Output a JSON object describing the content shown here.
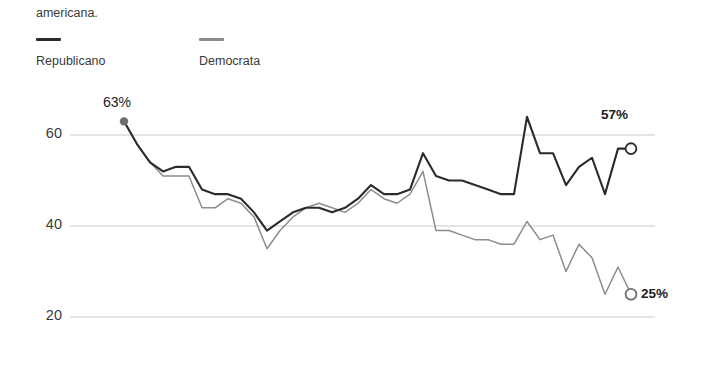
{
  "page": {
    "background": "#ffffff",
    "clipped_text_above": "",
    "paragraph_tail": "americana."
  },
  "legend": {
    "position": "top-left",
    "items": [
      {
        "label": "Republicano",
        "color": "#2b2b2b",
        "icon": "line-swatch-icon"
      },
      {
        "label": "Democrata",
        "color": "#8c8c8c",
        "icon": "line-swatch-icon"
      }
    ]
  },
  "annotations": {
    "start_value": "63%",
    "republicano_end": "57%",
    "democrata_end": "25%"
  },
  "chart_data": {
    "type": "line",
    "title": "",
    "subtitle": "",
    "xlabel": "",
    "ylabel": "",
    "ylim": [
      14,
      68
    ],
    "yticks": [
      20,
      40,
      60
    ],
    "ytick_labels": [
      "20",
      "40",
      "60"
    ],
    "xticks": [],
    "xtick_labels": [],
    "grid": "horizontal",
    "legend_position": "above-plot-left",
    "x": [
      0,
      1,
      2,
      3,
      4,
      5,
      6,
      7,
      8,
      9,
      10,
      11,
      12,
      13,
      14,
      15,
      16,
      17,
      18,
      19,
      20,
      21,
      22,
      23,
      24,
      25,
      26,
      27,
      28,
      29,
      30,
      31,
      32,
      33,
      34,
      35,
      36,
      37,
      38,
      39
    ],
    "series": [
      {
        "name": "Republicano",
        "color": "#2b2b2b",
        "start_marker": "filled-circle",
        "end_marker": "hollow-circle",
        "start_label": "63%",
        "end_label": "57%",
        "values": [
          63,
          58,
          54,
          52,
          53,
          53,
          48,
          47,
          47,
          46,
          43,
          39,
          41,
          43,
          44,
          44,
          43,
          44,
          46,
          49,
          47,
          47,
          48,
          56,
          51,
          50,
          50,
          49,
          48,
          47,
          47,
          64,
          56,
          56,
          49,
          53,
          55,
          47,
          57,
          57
        ]
      },
      {
        "name": "Democrata",
        "color": "#8c8c8c",
        "end_marker": "hollow-circle",
        "end_label": "25%",
        "values": [
          63,
          58,
          54,
          51,
          51,
          51,
          44,
          44,
          46,
          45,
          42,
          35,
          39,
          42,
          44,
          45,
          44,
          43,
          45,
          48,
          46,
          45,
          47,
          52,
          39,
          39,
          38,
          37,
          37,
          36,
          36,
          41,
          37,
          38,
          30,
          36,
          33,
          25,
          31,
          25
        ]
      }
    ]
  }
}
